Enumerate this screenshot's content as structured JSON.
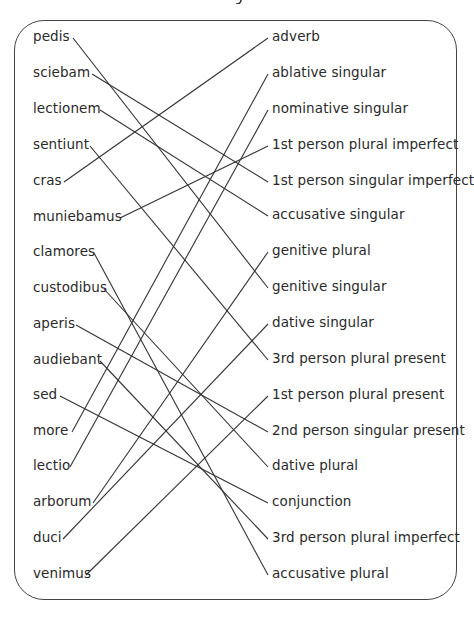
{
  "title_fragment": "g",
  "left_words": [
    {
      "text": "pedis",
      "y": 38
    },
    {
      "text": "sciebam",
      "y": 74
    },
    {
      "text": "lectionem",
      "y": 110
    },
    {
      "text": "sentiunt",
      "y": 146
    },
    {
      "text": "cras",
      "y": 182
    },
    {
      "text": "muniebamus",
      "y": 218
    },
    {
      "text": "clamores",
      "y": 253
    },
    {
      "text": "custodibus",
      "y": 289
    },
    {
      "text": "aperis",
      "y": 325
    },
    {
      "text": "audiebant",
      "y": 361
    },
    {
      "text": "sed",
      "y": 396
    },
    {
      "text": "more",
      "y": 432
    },
    {
      "text": "lectio",
      "y": 467
    },
    {
      "text": "arborum",
      "y": 503
    },
    {
      "text": "duci",
      "y": 539
    },
    {
      "text": "venimus",
      "y": 575
    }
  ],
  "right_labels": [
    {
      "text": "adverb",
      "y": 38
    },
    {
      "text": "ablative singular",
      "y": 74
    },
    {
      "text": "nominative singular",
      "y": 110
    },
    {
      "text": "1st person plural imperfect",
      "y": 146
    },
    {
      "text": "1st person singular imperfect",
      "y": 182
    },
    {
      "text": "accusative singular",
      "y": 216
    },
    {
      "text": "genitive plural",
      "y": 252
    },
    {
      "text": "genitive singular",
      "y": 288
    },
    {
      "text": "dative singular",
      "y": 324
    },
    {
      "text": "3rd person plural present",
      "y": 360
    },
    {
      "text": "1st person plural present",
      "y": 396
    },
    {
      "text": "2nd person singular present",
      "y": 432
    },
    {
      "text": "dative plural",
      "y": 467
    },
    {
      "text": "conjunction",
      "y": 503
    },
    {
      "text": "3rd person plural imperfect",
      "y": 539
    },
    {
      "text": "accusative plural",
      "y": 575
    }
  ],
  "connections": [
    {
      "from": "pedis",
      "to": "genitive singular",
      "x1": 73,
      "y1": 38,
      "x2": 268,
      "y2": 288
    },
    {
      "from": "sciebam",
      "to": "1st person singular imperfect",
      "x1": 92,
      "y1": 74,
      "x2": 268,
      "y2": 182
    },
    {
      "from": "lectionem",
      "to": "accusative singular",
      "x1": 100,
      "y1": 110,
      "x2": 268,
      "y2": 216
    },
    {
      "from": "sentiunt",
      "to": "3rd person plural present",
      "x1": 90,
      "y1": 146,
      "x2": 268,
      "y2": 360
    },
    {
      "from": "cras",
      "to": "adverb",
      "x1": 64,
      "y1": 182,
      "x2": 268,
      "y2": 38
    },
    {
      "from": "muniebamus",
      "to": "1st person plural imperfect",
      "x1": 120,
      "y1": 218,
      "x2": 268,
      "y2": 146
    },
    {
      "from": "clamores",
      "to": "accusative plural",
      "x1": 94,
      "y1": 253,
      "x2": 268,
      "y2": 575
    },
    {
      "from": "custodibus",
      "to": "dative plural",
      "x1": 104,
      "y1": 289,
      "x2": 268,
      "y2": 467
    },
    {
      "from": "aperis",
      "to": "2nd person singular present",
      "x1": 76,
      "y1": 325,
      "x2": 268,
      "y2": 432
    },
    {
      "from": "audiebant",
      "to": "3rd person plural imperfect",
      "x1": 100,
      "y1": 361,
      "x2": 268,
      "y2": 539
    },
    {
      "from": "sed",
      "to": "conjunction",
      "x1": 60,
      "y1": 396,
      "x2": 268,
      "y2": 503
    },
    {
      "from": "more",
      "to": "ablative singular",
      "x1": 72,
      "y1": 432,
      "x2": 268,
      "y2": 74
    },
    {
      "from": "lectio",
      "to": "nominative singular",
      "x1": 70,
      "y1": 467,
      "x2": 268,
      "y2": 110
    },
    {
      "from": "arborum",
      "to": "genitive plural",
      "x1": 93,
      "y1": 503,
      "x2": 268,
      "y2": 252
    },
    {
      "from": "duci",
      "to": "dative singular",
      "x1": 63,
      "y1": 539,
      "x2": 268,
      "y2": 324
    },
    {
      "from": "venimus",
      "to": "1st person plural present",
      "x1": 86,
      "y1": 575,
      "x2": 268,
      "y2": 396
    }
  ],
  "colors": {
    "line": "#333333",
    "text": "#2a2a2a",
    "frame": "#444444"
  }
}
